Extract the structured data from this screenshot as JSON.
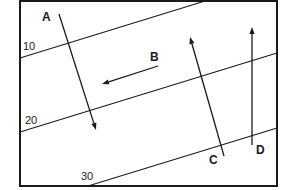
{
  "diagram": {
    "type": "contour map with flow arrows",
    "frame": {
      "x": 20,
      "y": 1,
      "width": 257,
      "height": 185
    },
    "contours": [
      {
        "label": "10",
        "x1": 20,
        "y1": 58,
        "x2": 205,
        "y2": 1,
        "label_x": 23,
        "label_y": 41
      },
      {
        "label": "20",
        "x1": 20,
        "y1": 132,
        "x2": 277,
        "y2": 53,
        "label_x": 25,
        "label_y": 115
      },
      {
        "label": "30",
        "x1": 88,
        "y1": 186,
        "x2": 277,
        "y2": 128,
        "label_x": 81,
        "label_y": 171
      }
    ],
    "arrows": [
      {
        "label": "A",
        "x1": 59,
        "y1": 14,
        "x2": 96,
        "y2": 130,
        "label_x": 42,
        "label_y": 11
      },
      {
        "label": "B",
        "x1": 158,
        "y1": 66,
        "x2": 102,
        "y2": 84,
        "label_x": 150,
        "label_y": 51
      },
      {
        "label": "C",
        "x1": 224,
        "y1": 156,
        "x2": 190,
        "y2": 37,
        "label_x": 209,
        "label_y": 154
      },
      {
        "label": "D",
        "x1": 252,
        "y1": 145,
        "x2": 252,
        "y2": 27,
        "label_x": 256,
        "label_y": 144
      }
    ],
    "colors": {
      "ink": "#1a1a1a",
      "background": "#ffffff"
    }
  }
}
